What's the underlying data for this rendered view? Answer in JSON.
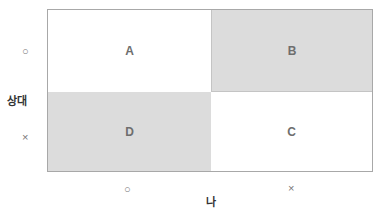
{
  "diagram": {
    "type": "2x2 matrix",
    "cells": {
      "top_left": {
        "label": "A",
        "shading": "white"
      },
      "top_right": {
        "label": "B",
        "shading": "gray"
      },
      "bottom_left": {
        "label": "D",
        "shading": "gray"
      },
      "bottom_right": {
        "label": "C",
        "shading": "white"
      }
    },
    "y_axis": {
      "title": "상대",
      "ticks": [
        "○",
        "×"
      ]
    },
    "x_axis": {
      "title": "나",
      "ticks": [
        "○",
        "×"
      ]
    },
    "colors": {
      "shaded": "#dcdcdc",
      "border": "#a8a8a8",
      "text": "#6e6e6e"
    }
  }
}
